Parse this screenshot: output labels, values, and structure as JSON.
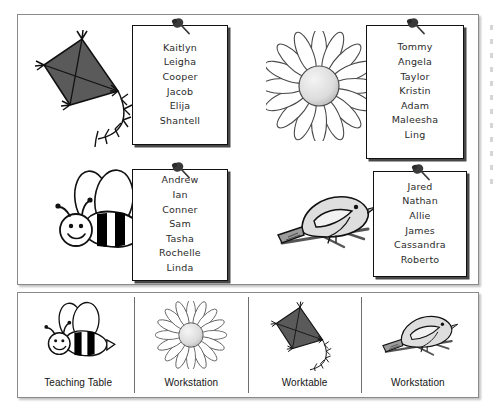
{
  "document": {
    "title": "Classroom Grouping Chart"
  },
  "groups": [
    {
      "id": "group-kite",
      "icon": "kite-icon",
      "names": [
        "Kaitlyn",
        "Leigha",
        "Cooper",
        "Jacob",
        "Elija",
        "Shantell"
      ]
    },
    {
      "id": "group-sunflower",
      "icon": "sunflower-icon",
      "names": [
        "Tommy",
        "Angela",
        "Taylor",
        "Kristin",
        "Adam",
        "Maleesha",
        "Ling"
      ]
    },
    {
      "id": "group-bee",
      "icon": "bee-icon",
      "names": [
        "Andrew",
        "Ian",
        "Conner",
        "Sam",
        "Tasha",
        "Rochelle",
        "Linda"
      ]
    },
    {
      "id": "group-bird",
      "icon": "bird-icon",
      "names": [
        "Jared",
        "Nathan",
        "Allie",
        "James",
        "Cassandra",
        "Roberto"
      ]
    }
  ],
  "stations": [
    {
      "id": "station-bee",
      "icon": "bee-icon",
      "label": "Teaching Table"
    },
    {
      "id": "station-sunflower",
      "icon": "sunflower-icon",
      "label": "Workstation"
    },
    {
      "id": "station-kite",
      "icon": "kite-icon",
      "label": "Worktable"
    },
    {
      "id": "station-bird",
      "icon": "bird-icon",
      "label": "Workstation"
    }
  ],
  "colors": {
    "panel_border": "#8a8a8a",
    "card_border": "#111111",
    "text": "#2b2b2b",
    "kite_fill": "#5a5a5a",
    "bee_stripe": "#000000",
    "bird_fill": "#d9d9d9",
    "flower_center": "#d8d8d8"
  },
  "pin": {
    "icon": "pushpin-icon"
  }
}
